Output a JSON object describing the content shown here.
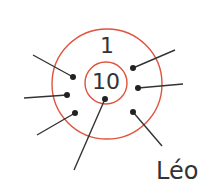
{
  "diagram": {
    "type": "target-rings",
    "colors": {
      "ring": "#e0533d",
      "line": "#333333",
      "text": "#333333",
      "background": "#ffffff"
    },
    "rings": [
      {
        "id": "outer",
        "label": "1",
        "cx": 107,
        "cy": 84,
        "r": 55
      },
      {
        "id": "inner",
        "label": "10",
        "cx": 106,
        "cy": 83,
        "r": 21
      }
    ],
    "leaders": [
      {
        "dot": [
          73,
          77
        ],
        "end": [
          33,
          55
        ],
        "label": ""
      },
      {
        "dot": [
          67,
          95
        ],
        "end": [
          24,
          98
        ],
        "label": ""
      },
      {
        "dot": [
          75,
          113
        ],
        "end": [
          37,
          135
        ],
        "label": ""
      },
      {
        "dot": [
          105,
          99
        ],
        "end": [
          74,
          170
        ],
        "label": ""
      },
      {
        "dot": [
          133,
          68
        ],
        "end": [
          175,
          50
        ],
        "label": ""
      },
      {
        "dot": [
          138,
          88
        ],
        "end": [
          183,
          84
        ],
        "label": ""
      },
      {
        "dot": [
          133,
          112
        ],
        "end": [
          162,
          146
        ],
        "label": "Léo"
      }
    ],
    "labels": {
      "outer_score": "1",
      "inner_score": "10",
      "player": "Léo"
    }
  }
}
